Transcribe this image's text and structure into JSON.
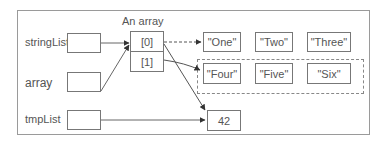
{
  "diagram": {
    "array_title": "An array",
    "variables": [
      {
        "name": "stringLists"
      },
      {
        "name": "array"
      },
      {
        "name": "tmpList"
      }
    ],
    "array_cells": [
      "[0]",
      "[1]"
    ],
    "list_one": [
      "\"One\"",
      "\"Two\"",
      "\"Three\""
    ],
    "list_two": [
      "\"Four\"",
      "\"Five\"",
      "\"Six\""
    ],
    "value_box": "42",
    "edges": [
      {
        "from": "stringLists",
        "to": "array[0]",
        "style": "solid"
      },
      {
        "from": "array",
        "to": "array[0]",
        "style": "solid"
      },
      {
        "from": "array[0]",
        "to": "list_one",
        "style": "dashed"
      },
      {
        "from": "array[1]",
        "to": "list_two",
        "style": "solid"
      },
      {
        "from": "array[0]",
        "to": "42",
        "style": "solid"
      },
      {
        "from": "tmpList",
        "to": "42",
        "style": "solid"
      }
    ]
  }
}
